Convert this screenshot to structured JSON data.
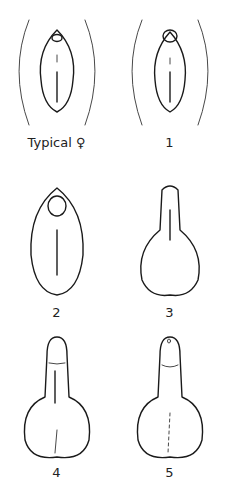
{
  "diagram": {
    "type": "staged anatomical scale (schematic line art)",
    "layout": "2 columns x 3 rows",
    "stroke_color": "#1a1a1a",
    "background": "#ffffff",
    "panels": [
      {
        "label": "Typical ♀",
        "stage": "typical-female"
      },
      {
        "label": "1",
        "stage": "1"
      },
      {
        "label": "2",
        "stage": "2"
      },
      {
        "label": "3",
        "stage": "3"
      },
      {
        "label": "4",
        "stage": "4"
      },
      {
        "label": "5",
        "stage": "5"
      }
    ]
  }
}
